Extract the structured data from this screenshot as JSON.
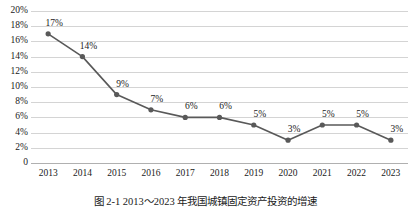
{
  "chart_data": {
    "type": "line",
    "title": "",
    "xlabel": "",
    "ylabel": "",
    "categories": [
      "2013",
      "2014",
      "2015",
      "2016",
      "2017",
      "2018",
      "2019",
      "2020",
      "2021",
      "2022",
      "2023"
    ],
    "values": [
      17,
      14,
      9,
      7,
      6,
      6,
      5,
      3,
      5,
      5,
      3
    ],
    "data_labels": [
      "17%",
      "14%",
      "9%",
      "7%",
      "6%",
      "6%",
      "5%",
      "3%",
      "5%",
      "5%",
      "3%"
    ],
    "ylim": [
      0,
      20
    ],
    "ytick_values": [
      20,
      18,
      16,
      14,
      12,
      10,
      8,
      6,
      4,
      2,
      0
    ],
    "ytick_labels": [
      "20%",
      "18%",
      "16%",
      "14%",
      "12%",
      "10%",
      "8%",
      "6%",
      "4%",
      "2%",
      "0"
    ],
    "grid": true,
    "legend": false,
    "legend_position": "none",
    "series_color": "#595959",
    "gridline_color": "#d4d4d4",
    "marker": "circle",
    "units": "percent"
  },
  "caption": {
    "text": "图 2-1  2013～2023 年我国城镇固定资产投资的增速"
  }
}
